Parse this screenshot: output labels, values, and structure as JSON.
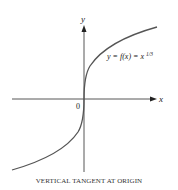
{
  "figure": {
    "axis_x_label": "x",
    "axis_y_label": "y",
    "origin_label": "0",
    "curve_label_prefix": "y = f(x) = x",
    "curve_label_exponent": "1/3",
    "caption": "VERTICAL TANGENT AT ORIGIN"
  },
  "colors": {
    "axis": "#333333",
    "curve": "#555555",
    "text": "#222222"
  }
}
